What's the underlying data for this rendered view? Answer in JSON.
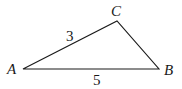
{
  "diagram": {
    "type": "triangle",
    "vertices": {
      "A": {
        "label": "A",
        "x": 23,
        "y": 69
      },
      "B": {
        "label": "B",
        "x": 159,
        "y": 69
      },
      "C": {
        "label": "C",
        "x": 117,
        "y": 21
      }
    },
    "sides": {
      "AC": {
        "label": "3"
      },
      "AB": {
        "label": "5"
      }
    },
    "stroke_color": "#1a1a1a"
  }
}
